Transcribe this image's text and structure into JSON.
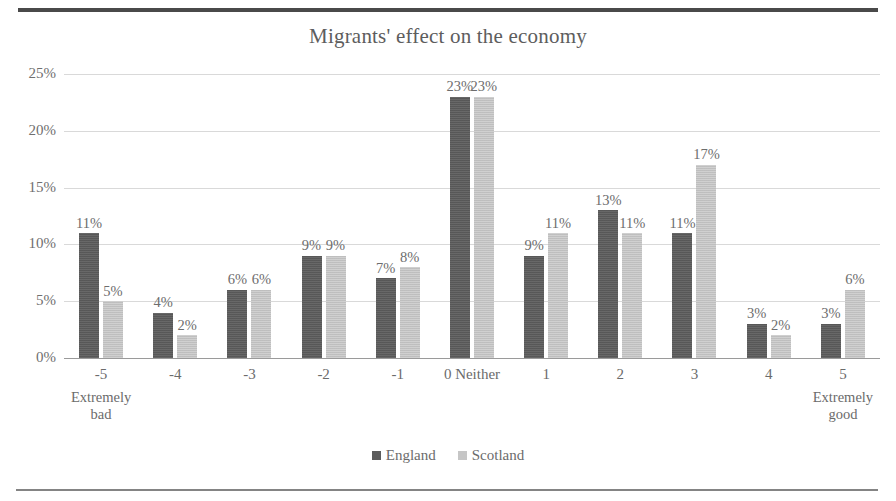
{
  "chart_data": {
    "type": "bar",
    "title": "Migrants' effect on the economy",
    "xlabel": "",
    "ylabel": "",
    "ylim": [
      0,
      25
    ],
    "ytick_labels": [
      "0%",
      "5%",
      "10%",
      "15%",
      "20%",
      "25%"
    ],
    "ytick_values": [
      0,
      5,
      10,
      15,
      20,
      25
    ],
    "grid": true,
    "legend_position": "bottom",
    "categories": [
      "-5",
      "-4",
      "-3",
      "-2",
      "-1",
      "0 Neither",
      "1",
      "2",
      "3",
      "4",
      "5"
    ],
    "category_sublabels": [
      "Extremely bad",
      "",
      "",
      "",
      "",
      "",
      "",
      "",
      "",
      "",
      "Extremely good"
    ],
    "series": [
      {
        "name": "England",
        "color": "#5c5c5c",
        "values": [
          11,
          4,
          6,
          9,
          7,
          23,
          9,
          13,
          11,
          3,
          3
        ],
        "labels": [
          "11%",
          "4%",
          "6%",
          "9%",
          "7%",
          "23%",
          "9%",
          "13%",
          "11%",
          "3%",
          "3%"
        ]
      },
      {
        "name": "Scotland",
        "color": "#c6c6c6",
        "values": [
          5,
          2,
          6,
          9,
          8,
          23,
          11,
          11,
          17,
          2,
          6
        ],
        "labels": [
          "5%",
          "2%",
          "6%",
          "9%",
          "8%",
          "23%",
          "11%",
          "11%",
          "17%",
          "2%",
          "6%"
        ]
      }
    ]
  },
  "legend": {
    "items": [
      {
        "label": "England",
        "color": "#5c5c5c"
      },
      {
        "label": "Scotland",
        "color": "#c6c6c6"
      }
    ]
  }
}
